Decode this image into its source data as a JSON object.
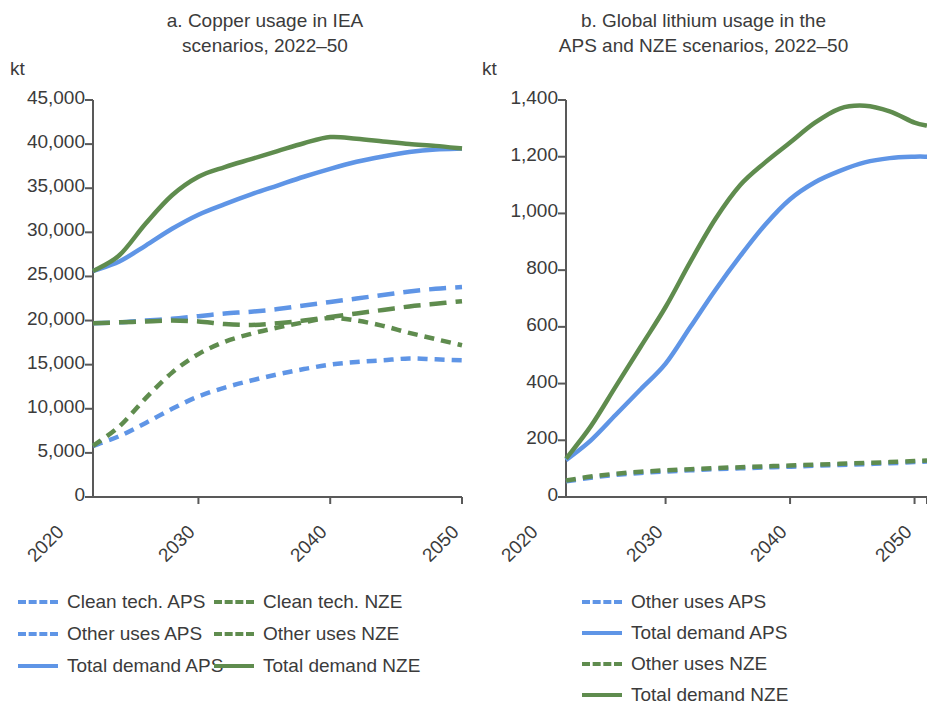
{
  "panels": [
    {
      "id": "a",
      "title": "a. Copper usage in IEA\nscenarios, 2022–50",
      "unit": "kt"
    },
    {
      "id": "b",
      "title": "b. Global lithium usage in the\nAPS and NZE scenarios, 2022–50",
      "unit": "kt"
    }
  ],
  "colors": {
    "blue": "#5f95e6",
    "green": "#5f8c4e",
    "axis": "#595959",
    "text": "#3b3b3b"
  },
  "chart_data": [
    {
      "type": "line",
      "panel": "a",
      "title": "a. Copper usage in IEA scenarios, 2022–50",
      "xlabel": "",
      "ylabel": "kt",
      "ylim": [
        0,
        45000
      ],
      "yticks": [
        "0",
        "5,000",
        "10,000",
        "15,000",
        "20,000",
        "25,000",
        "30,000",
        "35,000",
        "40,000",
        "45,000"
      ],
      "ytick_values": [
        0,
        5000,
        10000,
        15000,
        20000,
        25000,
        30000,
        35000,
        40000,
        45000
      ],
      "xlim": [
        2022,
        2050
      ],
      "xticks": [
        "2020",
        "2030",
        "2040",
        "2050"
      ],
      "xtick_values": [
        2020,
        2030,
        2040,
        2050
      ],
      "grid": false,
      "legend_position": "below",
      "x": [
        2022,
        2024,
        2026,
        2028,
        2030,
        2032,
        2034,
        2036,
        2038,
        2040,
        2042,
        2044,
        2046,
        2048,
        2050
      ],
      "series": [
        {
          "name": "Clean tech. APS",
          "color": "#5f95e6",
          "style": "dashed",
          "values": [
            5800,
            6900,
            8400,
            10000,
            11400,
            12400,
            13200,
            13900,
            14500,
            15000,
            15300,
            15500,
            15700,
            15600,
            15500
          ]
        },
        {
          "name": "Clean tech. NZE",
          "color": "#5f8c4e",
          "style": "dashed",
          "values": [
            5800,
            8000,
            11200,
            14100,
            16200,
            17600,
            18500,
            19200,
            19800,
            20300,
            20000,
            19400,
            18600,
            17900,
            17200
          ]
        },
        {
          "name": "Other uses APS",
          "color": "#5f95e6",
          "style": "dashed-wide",
          "values": [
            19700,
            19800,
            20000,
            20200,
            20500,
            20800,
            21000,
            21300,
            21700,
            22100,
            22500,
            22900,
            23300,
            23600,
            23800
          ]
        },
        {
          "name": "Other uses NZE",
          "color": "#5f8c4e",
          "style": "dashed-wide",
          "values": [
            19700,
            19800,
            19900,
            20000,
            19900,
            19600,
            19500,
            19700,
            20000,
            20400,
            20800,
            21200,
            21600,
            21900,
            22200
          ]
        },
        {
          "name": "Total demand APS",
          "color": "#5f95e6",
          "style": "solid",
          "values": [
            25600,
            26700,
            28500,
            30400,
            32000,
            33200,
            34300,
            35300,
            36300,
            37200,
            38000,
            38600,
            39100,
            39400,
            39500
          ]
        },
        {
          "name": "Total demand NZE",
          "color": "#5f8c4e",
          "style": "solid",
          "values": [
            25600,
            27400,
            31000,
            34200,
            36300,
            37400,
            38300,
            39200,
            40100,
            40800,
            40600,
            40300,
            40000,
            39800,
            39500
          ]
        }
      ]
    },
    {
      "type": "line",
      "panel": "b",
      "title": "b. Global lithium usage in the APS and NZE scenarios, 2022–50",
      "xlabel": "",
      "ylabel": "kt",
      "ylim": [
        0,
        1400
      ],
      "yticks": [
        "0",
        "200",
        "400",
        "600",
        "800",
        "1,000",
        "1,200",
        "1,400"
      ],
      "ytick_values": [
        0,
        200,
        400,
        600,
        800,
        1000,
        1200,
        1400
      ],
      "xlim": [
        2022,
        2051
      ],
      "xticks": [
        "2020",
        "2030",
        "2040",
        "2050"
      ],
      "xtick_values": [
        2020,
        2030,
        2040,
        2050
      ],
      "grid": false,
      "legend_position": "below",
      "x": [
        2022,
        2024,
        2026,
        2028,
        2030,
        2032,
        2034,
        2036,
        2038,
        2040,
        2042,
        2044,
        2046,
        2048,
        2050,
        2051
      ],
      "series": [
        {
          "name": "Other uses APS",
          "color": "#5f95e6",
          "style": "dashed",
          "values": [
            55,
            68,
            78,
            85,
            90,
            94,
            98,
            101,
            104,
            107,
            110,
            113,
            116,
            119,
            123,
            125
          ]
        },
        {
          "name": "Total demand APS",
          "color": "#5f95e6",
          "style": "solid",
          "values": [
            130,
            200,
            290,
            380,
            470,
            600,
            730,
            850,
            960,
            1050,
            1110,
            1150,
            1180,
            1195,
            1200,
            1200
          ]
        },
        {
          "name": "Other uses NZE",
          "color": "#5f8c4e",
          "style": "dashed",
          "values": [
            58,
            72,
            82,
            89,
            94,
            98,
            102,
            105,
            108,
            111,
            114,
            117,
            120,
            123,
            127,
            129
          ]
        },
        {
          "name": "Total demand NZE",
          "color": "#5f8c4e",
          "style": "solid",
          "values": [
            135,
            250,
            390,
            530,
            670,
            830,
            980,
            1100,
            1180,
            1250,
            1320,
            1370,
            1380,
            1360,
            1320,
            1310
          ]
        }
      ]
    }
  ],
  "legends": {
    "a": [
      {
        "label": "Clean tech. APS",
        "color": "#5f95e6",
        "style": "dashed"
      },
      {
        "label": "Clean tech. NZE",
        "color": "#5f8c4e",
        "style": "dashed"
      },
      {
        "label": "Other uses APS",
        "color": "#5f95e6",
        "style": "dashed-wide"
      },
      {
        "label": "Other uses NZE",
        "color": "#5f8c4e",
        "style": "dashed-wide"
      },
      {
        "label": "Total demand APS",
        "color": "#5f95e6",
        "style": "solid"
      },
      {
        "label": "Total demand NZE",
        "color": "#5f8c4e",
        "style": "solid"
      }
    ],
    "b": [
      {
        "label": "Other uses APS",
        "color": "#5f95e6",
        "style": "dashed"
      },
      {
        "label": "Total demand APS",
        "color": "#5f95e6",
        "style": "solid"
      },
      {
        "label": "Other uses NZE",
        "color": "#5f8c4e",
        "style": "dashed"
      },
      {
        "label": "Total demand NZE",
        "color": "#5f8c4e",
        "style": "solid"
      }
    ]
  }
}
